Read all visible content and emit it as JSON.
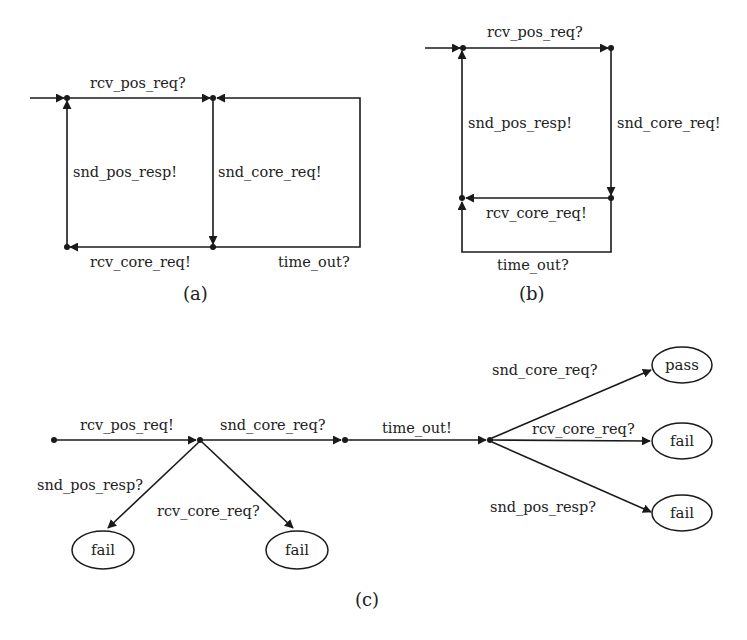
{
  "diagrams": {
    "a": {
      "caption": "(a)",
      "edges": {
        "top_left": "rcv_pos_req?",
        "left_up": "snd_pos_resp!",
        "mid_down": "snd_core_req!",
        "bottom_left": "rcv_core_req!",
        "loop_right": "time_out?"
      }
    },
    "b": {
      "caption": "(b)",
      "edges": {
        "top": "rcv_pos_req?",
        "left_up": "snd_pos_resp!",
        "right_down": "snd_core_req!",
        "middle_left": "rcv_core_req!",
        "loop_bottom": "time_out?"
      }
    },
    "c": {
      "caption": "(c)",
      "edges": {
        "e1": "rcv_pos_req!",
        "e2": "snd_core_req?",
        "e3": "time_out!",
        "fail_left_1": "snd_pos_resp?",
        "fail_left_2": "rcv_core_req?",
        "pass": "snd_core_req?",
        "fail_right_1": "rcv_core_req?",
        "fail_right_2": "snd_pos_resp?"
      },
      "verdicts": {
        "v1": "fail",
        "v2": "fail",
        "v3": "pass",
        "v4": "fail",
        "v5": "fail"
      }
    }
  },
  "colors": {
    "ink": "#1a1a1a",
    "background": "#ffffff"
  }
}
